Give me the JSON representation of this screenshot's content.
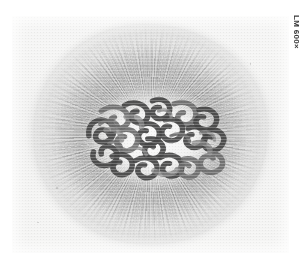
{
  "figure": {
    "kind": "light-micrograph",
    "magnification_label": "LM 600×",
    "colors": {
      "page_background": "#ffffff",
      "plate_background": "#f4f4f3",
      "cytoplasm_halo": "#d2d2d2",
      "nucleoplasm": "#fafafa",
      "chromosome_dark": "#454545",
      "chromosome_mid": "#5b5b5b",
      "chromosome_light": "#868686",
      "label_text": "#3a3a3a"
    },
    "plate": {
      "x": 12,
      "y": 16,
      "width": 277,
      "height": 237
    }
  }
}
